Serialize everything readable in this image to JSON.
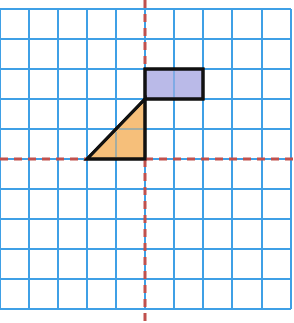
{
  "diagram": {
    "type": "coordinate-grid",
    "grid": {
      "columns": 10,
      "rows": 10,
      "line_color": "#3fa0e6",
      "background": "#ffffff",
      "x_lines": [
        0,
        29,
        58,
        87,
        116,
        145,
        174,
        203,
        232,
        262,
        291
      ],
      "y_lines": [
        9,
        39,
        69,
        99,
        129,
        159,
        189,
        219,
        249,
        279,
        309
      ]
    },
    "axes": {
      "color": "#c0504d",
      "style": "dashed",
      "vertical_x": 145,
      "horizontal_y": 159
    },
    "shapes": [
      {
        "name": "rectangle",
        "fill": "#b3b3e6",
        "stroke": "#111111",
        "points": [
          [
            145,
            69
          ],
          [
            203,
            69
          ],
          [
            203,
            99
          ],
          [
            145,
            99
          ]
        ]
      },
      {
        "name": "triangle",
        "fill": "#f5b86b",
        "stroke": "#111111",
        "points": [
          [
            87,
            159
          ],
          [
            145,
            99
          ],
          [
            145,
            159
          ]
        ]
      }
    ]
  }
}
